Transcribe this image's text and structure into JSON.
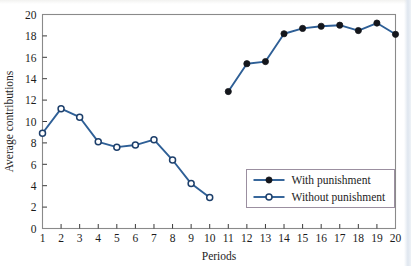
{
  "chart_data": {
    "type": "line",
    "title": "",
    "xlabel": "Periods",
    "ylabel": "Average contributions",
    "xlim": [
      1,
      20
    ],
    "ylim": [
      0,
      20
    ],
    "yticks": [
      0,
      2,
      4,
      6,
      8,
      10,
      12,
      14,
      16,
      18,
      20
    ],
    "xticks": [
      1,
      2,
      3,
      4,
      5,
      6,
      7,
      8,
      9,
      10,
      11,
      12,
      13,
      14,
      15,
      16,
      17,
      18,
      19,
      20
    ],
    "grid": false,
    "legend_position": "lower-right",
    "series": [
      {
        "name": "Without punishment",
        "marker": "open-circle",
        "color": "#2e5f96",
        "x": [
          1,
          2,
          3,
          4,
          5,
          6,
          7,
          8,
          9,
          10
        ],
        "values": [
          8.9,
          11.2,
          10.4,
          8.1,
          7.6,
          7.8,
          8.3,
          6.4,
          4.2,
          2.9
        ]
      },
      {
        "name": "With punishment",
        "marker": "filled-circle",
        "color": "#2e5f96",
        "x": [
          11,
          12,
          13,
          14,
          15,
          16,
          17,
          18,
          19,
          20
        ],
        "values": [
          12.8,
          15.4,
          15.6,
          18.2,
          18.7,
          18.9,
          19.0,
          18.5,
          19.2,
          18.15
        ]
      }
    ]
  },
  "legend": {
    "entries": [
      {
        "label": "With punishment",
        "marker": "filled-circle"
      },
      {
        "label": "Without punishment",
        "marker": "open-circle"
      }
    ]
  },
  "axes": {
    "x_title": "Periods",
    "y_title": "Average contributions",
    "y_tick_labels": [
      "0",
      "2",
      "4",
      "6",
      "8",
      "10",
      "12",
      "14",
      "16",
      "18",
      "20"
    ],
    "x_tick_labels": [
      "1",
      "2",
      "3",
      "4",
      "5",
      "6",
      "7",
      "8",
      "9",
      "10",
      "11",
      "12",
      "13",
      "14",
      "15",
      "16",
      "17",
      "18",
      "19",
      "20"
    ]
  },
  "colors": {
    "line": "#2e5f96",
    "marker_fill": "#14161c",
    "frame": "#8a8a8a",
    "legend_border": "#9b8fa0",
    "text": "#1c1c1c"
  }
}
